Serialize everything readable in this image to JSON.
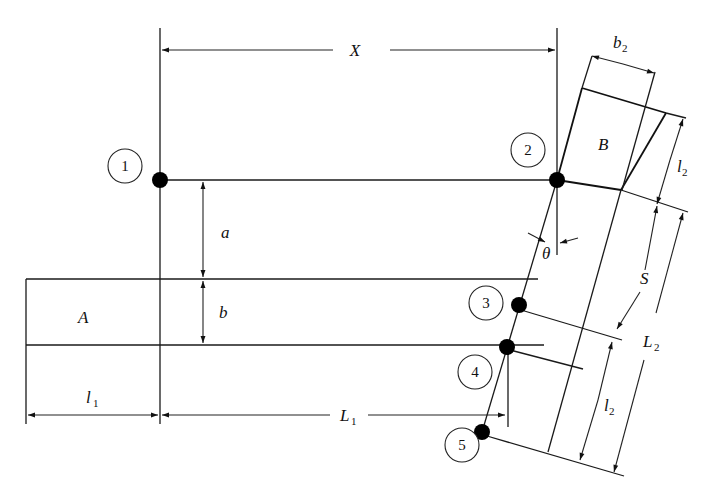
{
  "diagram": {
    "type": "engineering-schematic",
    "nodes": [
      {
        "id": "1",
        "label": "1"
      },
      {
        "id": "2",
        "label": "2"
      },
      {
        "id": "3",
        "label": "3"
      },
      {
        "id": "4",
        "label": "4"
      },
      {
        "id": "5",
        "label": "5"
      }
    ],
    "regions": {
      "A": "A",
      "B": "B"
    },
    "dimensions": {
      "X": "X",
      "a": "a",
      "b": "b",
      "l1_main": "l",
      "l1_sub": "1",
      "L1_main": "L",
      "L1_sub": "1",
      "b2_main": "b",
      "b2_sub": "2",
      "l2_top_main": "l",
      "l2_top_sub": "2",
      "S": "S",
      "L2_main": "L",
      "L2_sub": "2",
      "l2_bottom_main": "l",
      "l2_bottom_sub": "2",
      "theta": "θ"
    }
  }
}
